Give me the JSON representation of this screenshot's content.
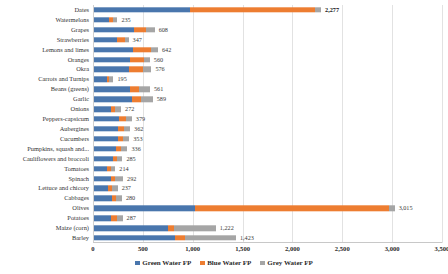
{
  "chart_data": {
    "type": "bar",
    "subtype": "stacked-horizontal-bar",
    "title": "",
    "xlabel": "",
    "ylabel": "",
    "xlim": [
      0,
      3500
    ],
    "xticks": [
      "0",
      "500",
      "1,000",
      "1,500",
      "2,000",
      "2,500",
      "3,000",
      "3,500"
    ],
    "xtick_values": [
      0,
      500,
      1000,
      1500,
      2000,
      2500,
      3000,
      3500
    ],
    "grid": true,
    "grid_axis": "x",
    "legend_position": "bottom-center",
    "orientation": "horizontal",
    "categories": [
      "Dates",
      "Watermelons",
      "Grapes",
      "Strawberries",
      "Lemons and limes",
      "Oranges",
      "Okra",
      "Carrots and Turnips",
      "Beans (greens)",
      "Garlic",
      "Onions",
      "Peppers-capsicum",
      "Aubergines",
      "Cucumbers",
      "Pumpkins, squash and...",
      "Cauliflowers and broccoli",
      "Tomatoes",
      "Spinach",
      "Lettuce and chicory",
      "Cabbages",
      "Olives",
      "Potatoes",
      "Maize (corn)",
      "Barley"
    ],
    "series": [
      {
        "name": "Green Water FP",
        "color": "#4976ad",
        "values": [
          962,
          150,
          405,
          235,
          395,
          360,
          355,
          130,
          365,
          380,
          170,
          255,
          240,
          240,
          225,
          195,
          130,
          175,
          140,
          185,
          1010,
          175,
          740,
          810
        ]
      },
      {
        "name": "Blue Water FP",
        "color": "#ed7d31",
        "values": [
          1250,
          40,
          120,
          75,
          180,
          140,
          135,
          20,
          85,
          90,
          40,
          65,
          60,
          55,
          50,
          40,
          45,
          35,
          45,
          40,
          1945,
          55,
          60,
          100
        ]
      },
      {
        "name": "Grey Water FP",
        "color": "#a5a5a5",
        "values": [
          65,
          45,
          83,
          37,
          67,
          60,
          86,
          45,
          111,
          119,
          62,
          59,
          62,
          58,
          61,
          50,
          39,
          82,
          52,
          55,
          60,
          57,
          422,
          513
        ]
      }
    ],
    "totals": [
      2277,
      235,
      608,
      347,
      642,
      560,
      576,
      195,
      561,
      589,
      272,
      379,
      362,
      353,
      336,
      285,
      214,
      292,
      237,
      280,
      3015,
      287,
      1222,
      1423
    ],
    "data_labels": [
      "2,277",
      "235",
      "608",
      "347",
      "642",
      "560",
      "576",
      "195",
      "561",
      "589",
      "272",
      "379",
      "362",
      "353",
      "336",
      "285",
      "214",
      "292",
      "237",
      "280",
      "3,015",
      "287",
      "1,222",
      "1,423"
    ],
    "bold_labels": [
      "2,277"
    ]
  },
  "legend": {
    "items": [
      {
        "label": "Green Water FP",
        "color": "#4976ad"
      },
      {
        "label": "Blue Water FP",
        "color": "#ed7d31"
      },
      {
        "label": "Grey Water FP",
        "color": "#a5a5a5"
      }
    ]
  },
  "top_clipped_legend": "Green Water FP     Blue Water FP     Grey Water FP"
}
